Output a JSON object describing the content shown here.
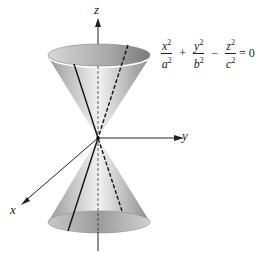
{
  "figure": {
    "axes": {
      "z_label": "z",
      "y_label": "y",
      "x_label": "x"
    },
    "equation": {
      "terms": [
        {
          "num": "x",
          "den": "a",
          "exp": "2"
        },
        {
          "num": "y",
          "den": "b",
          "exp": "2"
        },
        {
          "num": "z",
          "den": "c",
          "exp": "2"
        }
      ],
      "ops": [
        "+",
        "−"
      ],
      "rhs": "= 0"
    }
  }
}
